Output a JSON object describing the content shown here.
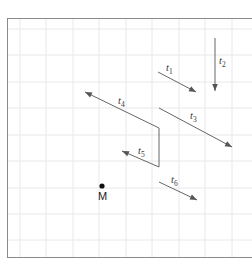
{
  "figure": {
    "background_color": "#ffffff",
    "frame_color": "#8a8a8a",
    "grid_color": "#e8e8ee",
    "arrow_color": "#555555",
    "label_color": "#3a3a3a",
    "point_color": "#111111",
    "grid_spacing": 26.5,
    "frame": {
      "x": 7,
      "y": 18,
      "width": 245,
      "height": 239
    }
  },
  "point": {
    "name": "M",
    "label": "M",
    "x": 102,
    "y": 186
  },
  "vectors": [
    {
      "id": "t1",
      "label": "t",
      "sub": "1",
      "x1": 158,
      "y1": 72,
      "x2": 196,
      "y2": 92,
      "arrowhead": "end",
      "label_x": 166,
      "label_y": 63
    },
    {
      "id": "t2",
      "label": "t",
      "sub": "2",
      "x1": 215,
      "y1": 38,
      "x2": 215,
      "y2": 91,
      "arrowhead": "end",
      "label_x": 219,
      "label_y": 56
    },
    {
      "id": "t3",
      "label": "t",
      "sub": "3",
      "x1": 159,
      "y1": 108,
      "x2": 232,
      "y2": 147,
      "arrowhead": "end",
      "label_x": 190,
      "label_y": 111
    },
    {
      "id": "t4",
      "label": "t",
      "sub": "4",
      "x1": 159,
      "y1": 128,
      "x2": 85,
      "y2": 92,
      "arrowhead": "end",
      "label_x": 118,
      "label_y": 96
    },
    {
      "id": "t5",
      "label": "t",
      "sub": "5",
      "x1": 159,
      "y1": 167,
      "x2": 122,
      "y2": 151,
      "arrowhead": "end",
      "label_x": 138,
      "label_y": 146
    },
    {
      "id": "t6",
      "label": "t",
      "sub": "6",
      "x1": 159,
      "y1": 182,
      "x2": 197,
      "y2": 200,
      "arrowhead": "end",
      "label_x": 171,
      "label_y": 175
    }
  ],
  "connectors": [
    {
      "id": "connector-t4-t5",
      "x1": 159,
      "y1": 128,
      "x2": 159,
      "y2": 167
    }
  ],
  "gridlines": {
    "vertical": [
      20,
      46,
      73,
      99,
      126,
      152,
      179,
      205,
      232
    ],
    "horizontal": [
      29,
      55,
      82,
      108,
      135,
      161,
      188,
      214,
      240
    ]
  }
}
